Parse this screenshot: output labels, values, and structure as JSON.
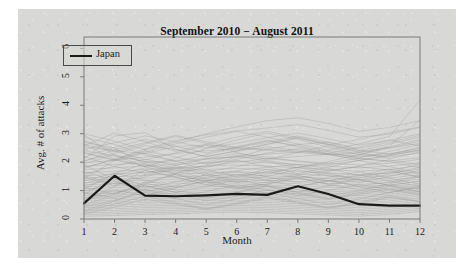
{
  "figure": {
    "background_color": "#d8d8d6",
    "page_color": "#ffffff"
  },
  "chart_data": {
    "type": "line",
    "title": "September 2010 − August 2011",
    "xlabel": "Month",
    "ylabel": "Avg. # of attacks",
    "xlim": [
      1,
      12
    ],
    "ylim": [
      0,
      6.4
    ],
    "xticks": [
      1,
      2,
      3,
      4,
      5,
      6,
      7,
      8,
      9,
      10,
      11,
      12
    ],
    "yticks": [
      0,
      1,
      2,
      3,
      4,
      5,
      6
    ],
    "grid": false,
    "legend": {
      "position": "top-left",
      "entries": [
        {
          "name": "Japan",
          "color": "#1a1a1a"
        }
      ]
    },
    "x": [
      1,
      2,
      3,
      4,
      5,
      6,
      7,
      8,
      9,
      10,
      11,
      12
    ],
    "highlight_series": {
      "name": "Japan",
      "color": "#1a1a1a",
      "linewidth": 2.2,
      "values": [
        0.55,
        1.52,
        0.82,
        0.8,
        0.83,
        0.88,
        0.85,
        1.15,
        0.88,
        0.52,
        0.47,
        0.47
      ]
    },
    "background_series_color": "#8f8f8f",
    "background_series": [
      {
        "name": "country-01",
        "values": [
          2.55,
          2.4,
          2.3,
          2.55,
          2.6,
          2.52,
          2.45,
          2.38,
          2.3,
          2.22,
          2.3,
          2.42
        ]
      },
      {
        "name": "country-02",
        "values": [
          2.4,
          2.22,
          2.02,
          1.96,
          2.1,
          2.2,
          2.28,
          2.35,
          2.4,
          2.28,
          2.18,
          2.32
        ]
      },
      {
        "name": "country-03",
        "values": [
          2.62,
          2.1,
          1.88,
          1.75,
          1.86,
          2.0,
          2.12,
          2.2,
          2.28,
          2.18,
          2.26,
          2.5
        ]
      },
      {
        "name": "country-04",
        "values": [
          1.98,
          2.06,
          2.18,
          2.3,
          2.4,
          2.48,
          2.42,
          2.34,
          2.26,
          2.12,
          2.04,
          2.16
        ]
      },
      {
        "name": "country-05",
        "values": [
          1.86,
          1.92,
          1.98,
          2.06,
          2.12,
          2.18,
          2.12,
          2.04,
          1.96,
          1.9,
          1.96,
          2.1
        ]
      },
      {
        "name": "country-06",
        "values": [
          1.74,
          1.8,
          1.86,
          1.92,
          1.98,
          2.04,
          1.98,
          1.92,
          1.86,
          1.8,
          1.86,
          1.98
        ]
      },
      {
        "name": "country-07",
        "values": [
          1.62,
          1.68,
          1.74,
          1.8,
          1.86,
          1.9,
          1.86,
          1.8,
          1.74,
          1.68,
          1.74,
          1.88
        ]
      },
      {
        "name": "country-08",
        "values": [
          1.52,
          1.58,
          1.64,
          1.7,
          1.74,
          1.78,
          1.74,
          1.68,
          1.62,
          1.56,
          1.62,
          1.76
        ]
      },
      {
        "name": "country-09",
        "values": [
          1.44,
          1.48,
          1.54,
          1.58,
          1.62,
          1.66,
          1.62,
          1.58,
          1.52,
          1.46,
          1.52,
          1.66
        ]
      },
      {
        "name": "country-10",
        "values": [
          1.36,
          1.4,
          1.44,
          1.48,
          1.52,
          1.56,
          1.52,
          1.48,
          1.42,
          1.38,
          1.44,
          1.56
        ]
      },
      {
        "name": "country-11",
        "values": [
          1.28,
          1.32,
          1.36,
          1.4,
          1.44,
          1.48,
          1.44,
          1.4,
          1.34,
          1.3,
          1.36,
          1.48
        ]
      },
      {
        "name": "country-12",
        "values": [
          1.2,
          1.24,
          1.28,
          1.32,
          1.36,
          1.4,
          1.36,
          1.32,
          1.26,
          1.22,
          1.28,
          1.4
        ]
      },
      {
        "name": "country-13",
        "values": [
          1.14,
          1.16,
          1.2,
          1.24,
          1.28,
          1.32,
          1.28,
          1.24,
          1.18,
          1.14,
          1.2,
          1.32
        ]
      },
      {
        "name": "country-14",
        "values": [
          1.06,
          1.1,
          1.14,
          1.16,
          1.2,
          1.24,
          1.2,
          1.16,
          1.12,
          1.08,
          1.14,
          1.24
        ]
      },
      {
        "name": "country-15",
        "values": [
          1.0,
          1.02,
          1.06,
          1.1,
          1.14,
          1.16,
          1.14,
          1.1,
          1.04,
          1.0,
          1.06,
          1.18
        ]
      },
      {
        "name": "country-16",
        "values": [
          0.94,
          0.96,
          1.0,
          1.04,
          1.06,
          1.1,
          1.06,
          1.02,
          0.98,
          0.94,
          1.0,
          1.1
        ]
      },
      {
        "name": "country-17",
        "values": [
          0.88,
          0.9,
          0.94,
          0.96,
          1.0,
          1.02,
          1.0,
          0.96,
          0.92,
          0.88,
          0.94,
          1.04
        ]
      },
      {
        "name": "country-18",
        "values": [
          0.82,
          0.84,
          0.88,
          0.9,
          0.94,
          0.96,
          0.94,
          0.9,
          0.86,
          0.82,
          0.88,
          0.98
        ]
      },
      {
        "name": "country-19",
        "values": [
          0.76,
          0.78,
          0.82,
          0.84,
          0.88,
          0.9,
          0.88,
          0.84,
          0.8,
          0.76,
          0.82,
          0.92
        ]
      },
      {
        "name": "country-20",
        "values": [
          0.7,
          0.72,
          0.76,
          0.78,
          0.82,
          0.84,
          0.82,
          0.78,
          0.74,
          0.7,
          0.76,
          0.86
        ]
      },
      {
        "name": "country-21",
        "values": [
          0.64,
          0.66,
          0.7,
          0.72,
          0.76,
          0.78,
          0.76,
          0.72,
          0.68,
          0.64,
          0.7,
          0.8
        ]
      },
      {
        "name": "country-22",
        "values": [
          0.58,
          0.6,
          0.64,
          0.66,
          0.7,
          0.72,
          0.7,
          0.66,
          0.62,
          0.58,
          0.64,
          0.74
        ]
      },
      {
        "name": "country-23",
        "values": [
          0.52,
          0.54,
          0.58,
          0.6,
          0.64,
          0.66,
          0.64,
          0.6,
          0.56,
          0.52,
          0.58,
          0.68
        ]
      },
      {
        "name": "country-24",
        "values": [
          0.46,
          0.48,
          0.52,
          0.54,
          0.58,
          0.6,
          0.58,
          0.54,
          0.5,
          0.46,
          0.52,
          0.62
        ]
      },
      {
        "name": "country-25",
        "values": [
          0.4,
          0.42,
          0.46,
          0.48,
          0.52,
          0.54,
          0.52,
          0.48,
          0.44,
          0.4,
          0.46,
          0.56
        ]
      },
      {
        "name": "country-26",
        "values": [
          0.34,
          0.36,
          0.4,
          0.42,
          0.46,
          0.48,
          0.46,
          0.42,
          0.38,
          0.34,
          0.4,
          0.5
        ]
      },
      {
        "name": "country-27",
        "values": [
          0.28,
          0.3,
          0.34,
          0.36,
          0.4,
          0.42,
          0.4,
          0.36,
          0.32,
          0.28,
          0.34,
          0.44
        ]
      },
      {
        "name": "country-28",
        "values": [
          0.22,
          0.24,
          0.28,
          0.3,
          0.34,
          0.36,
          0.34,
          0.3,
          0.26,
          0.22,
          0.28,
          0.38
        ]
      },
      {
        "name": "country-29",
        "values": [
          0.16,
          0.18,
          0.22,
          0.24,
          0.28,
          0.3,
          0.28,
          0.24,
          0.2,
          0.16,
          0.22,
          0.32
        ]
      },
      {
        "name": "country-30",
        "values": [
          0.1,
          0.12,
          0.16,
          0.18,
          0.22,
          0.24,
          0.22,
          0.18,
          0.14,
          0.1,
          0.16,
          0.26
        ]
      },
      {
        "name": "country-31",
        "values": [
          1.9,
          1.4,
          1.1,
          1.3,
          1.55,
          1.7,
          1.82,
          1.92,
          1.78,
          1.52,
          1.62,
          1.98
        ]
      },
      {
        "name": "country-32",
        "values": [
          1.05,
          1.6,
          1.95,
          1.7,
          1.42,
          1.28,
          1.38,
          1.56,
          1.7,
          1.84,
          1.72,
          1.48
        ]
      },
      {
        "name": "country-33",
        "values": [
          2.2,
          1.85,
          1.6,
          1.88,
          2.12,
          2.3,
          2.18,
          2.02,
          1.9,
          2.06,
          2.24,
          2.4
        ]
      },
      {
        "name": "country-34",
        "values": [
          0.6,
          1.15,
          1.72,
          1.48,
          1.2,
          1.08,
          1.22,
          1.44,
          1.62,
          1.38,
          1.18,
          1.34
        ]
      },
      {
        "name": "country-35",
        "values": [
          2.7,
          2.5,
          1.92,
          1.62,
          1.9,
          2.18,
          2.46,
          2.62,
          2.7,
          2.42,
          2.28,
          2.52
        ]
      },
      {
        "name": "country-36",
        "values": [
          1.42,
          2.05,
          2.32,
          2.04,
          1.72,
          1.5,
          1.64,
          1.82,
          1.96,
          2.14,
          2.02,
          1.8
        ]
      },
      {
        "name": "country-37",
        "values": [
          0.92,
          0.74,
          1.22,
          1.6,
          1.38,
          1.14,
          1.3,
          1.52,
          1.36,
          1.16,
          1.3,
          1.54
        ]
      },
      {
        "name": "country-38",
        "values": [
          2.05,
          2.3,
          2.58,
          2.44,
          2.2,
          2.38,
          2.54,
          2.42,
          2.26,
          2.34,
          2.5,
          2.66
        ]
      },
      {
        "name": "country-39",
        "values": [
          0.3,
          0.62,
          1.04,
          0.86,
          0.64,
          0.8,
          1.02,
          0.88,
          0.7,
          0.86,
          1.06,
          0.9
        ]
      },
      {
        "name": "country-40",
        "values": [
          1.68,
          1.34,
          0.96,
          1.18,
          1.46,
          1.66,
          1.48,
          1.28,
          1.46,
          1.66,
          1.44,
          1.22
        ]
      },
      {
        "name": "country-41",
        "values": [
          2.45,
          2.68,
          2.92,
          2.72,
          2.5,
          2.66,
          2.86,
          3.02,
          2.82,
          2.6,
          2.76,
          3.0
        ]
      },
      {
        "name": "country-42",
        "values": [
          1.12,
          0.88,
          1.3,
          1.56,
          1.3,
          1.06,
          1.24,
          1.46,
          1.22,
          1.02,
          1.24,
          1.48
        ]
      },
      {
        "name": "country-43",
        "values": [
          2.32,
          2.08,
          2.46,
          2.76,
          2.96,
          3.1,
          3.2,
          3.32,
          3.12,
          2.88,
          2.98,
          3.22
        ]
      },
      {
        "name": "country-44",
        "values": [
          0.48,
          0.86,
          1.26,
          1.02,
          0.8,
          0.96,
          1.18,
          1.04,
          0.84,
          0.98,
          1.2,
          1.06
        ]
      },
      {
        "name": "country-45",
        "values": [
          1.78,
          2.12,
          2.4,
          2.18,
          1.94,
          2.1,
          2.32,
          2.48,
          2.28,
          2.06,
          2.22,
          2.44
        ]
      },
      {
        "name": "country-46",
        "values": [
          2.88,
          2.62,
          2.26,
          2.02,
          2.26,
          2.52,
          2.74,
          2.58,
          2.36,
          2.14,
          2.38,
          2.62
        ]
      },
      {
        "name": "country-47",
        "values": [
          0.98,
          1.28,
          1.02,
          0.78,
          0.96,
          1.2,
          1.02,
          0.82,
          1.0,
          1.22,
          1.04,
          0.84
        ]
      },
      {
        "name": "country-48",
        "values": [
          1.58,
          1.86,
          2.1,
          1.88,
          1.66,
          1.84,
          2.06,
          1.88,
          1.68,
          1.86,
          2.08,
          1.9
        ]
      },
      {
        "name": "country-49",
        "values": [
          2.12,
          2.92,
          3.04,
          2.46,
          2.18,
          2.4,
          2.62,
          2.84,
          2.62,
          2.36,
          2.54,
          2.8
        ]
      },
      {
        "name": "country-50",
        "values": [
          0.72,
          1.02,
          0.82,
          1.1,
          1.34,
          1.12,
          0.9,
          1.14,
          1.36,
          1.14,
          0.92,
          1.16
        ]
      },
      {
        "name": "country-51",
        "values": [
          2.96,
          2.24,
          1.84,
          2.14,
          2.48,
          2.78,
          3.02,
          2.8,
          2.52,
          2.26,
          2.5,
          2.74
        ]
      },
      {
        "name": "country-52",
        "values": [
          1.24,
          1.54,
          1.8,
          1.56,
          1.32,
          1.52,
          1.74,
          1.54,
          1.32,
          1.52,
          1.76,
          1.58
        ]
      },
      {
        "name": "country-53",
        "values": [
          0.18,
          0.42,
          0.7,
          0.52,
          0.34,
          0.52,
          0.74,
          0.56,
          0.38,
          0.54,
          0.76,
          0.6
        ]
      },
      {
        "name": "country-54",
        "values": [
          2.58,
          3.02,
          2.72,
          2.38,
          2.62,
          2.88,
          3.08,
          2.86,
          2.6,
          2.8,
          3.04,
          3.24
        ]
      },
      {
        "name": "country-55",
        "values": [
          1.46,
          1.18,
          1.48,
          1.78,
          1.54,
          1.3,
          1.5,
          1.74,
          1.52,
          1.28,
          1.5,
          1.72
        ]
      },
      {
        "name": "country-56",
        "values": [
          0.86,
          1.46,
          1.18,
          0.94,
          1.14,
          1.38,
          1.16,
          0.94,
          1.16,
          1.4,
          1.18,
          0.96
        ]
      },
      {
        "name": "country-57",
        "values": [
          2.02,
          2.44,
          2.68,
          2.94,
          2.72,
          2.5,
          2.7,
          2.92,
          2.7,
          2.48,
          2.7,
          2.94
        ]
      },
      {
        "name": "country-58",
        "values": [
          3.0,
          2.74,
          2.44,
          2.7,
          3.0,
          3.24,
          3.46,
          3.56,
          3.36,
          3.08,
          3.22,
          3.46
        ]
      },
      {
        "name": "country-59",
        "values": [
          2.34,
          2.06,
          2.36,
          2.64,
          2.88,
          3.08,
          2.88,
          2.64,
          2.42,
          2.64,
          2.9,
          4.18
        ]
      },
      {
        "name": "country-60",
        "values": [
          1.94,
          2.26,
          2.02,
          1.78,
          2.0,
          2.24,
          2.02,
          1.8,
          2.02,
          2.26,
          2.56,
          3.48
        ]
      },
      {
        "name": "country-61",
        "values": [
          0.42,
          0.66,
          0.94,
          0.72,
          0.5,
          0.7,
          0.92,
          0.72,
          0.52,
          0.7,
          0.94,
          1.12
        ]
      },
      {
        "name": "country-62",
        "values": [
          1.34,
          1.62,
          1.36,
          1.12,
          1.34,
          1.58,
          1.36,
          1.14,
          1.34,
          1.56,
          1.34,
          1.14
        ]
      },
      {
        "name": "country-63",
        "values": [
          2.76,
          2.4,
          2.08,
          2.32,
          2.58,
          2.34,
          2.1,
          2.34,
          2.58,
          2.34,
          2.12,
          2.36
        ]
      },
      {
        "name": "country-64",
        "values": [
          0.64,
          0.92,
          1.16,
          0.94,
          0.72,
          0.92,
          1.14,
          0.94,
          0.72,
          0.92,
          1.14,
          0.96
        ]
      },
      {
        "name": "country-65",
        "values": [
          1.52,
          1.24,
          1.54,
          1.82,
          1.6,
          1.36,
          1.58,
          1.82,
          1.58,
          1.36,
          1.58,
          1.82
        ]
      },
      {
        "name": "country-66",
        "values": [
          2.18,
          2.52,
          2.8,
          2.56,
          2.32,
          2.54,
          2.78,
          2.54,
          2.3,
          2.52,
          2.78,
          2.56
        ]
      },
      {
        "name": "country-67",
        "values": [
          0.26,
          0.52,
          0.8,
          0.58,
          0.36,
          0.56,
          0.8,
          0.6,
          0.4,
          0.58,
          0.82,
          0.62
        ]
      },
      {
        "name": "country-68",
        "values": [
          1.16,
          1.44,
          1.7,
          1.46,
          1.22,
          1.44,
          1.68,
          1.44,
          1.22,
          1.44,
          1.68,
          1.46
        ]
      },
      {
        "name": "country-69",
        "values": [
          2.64,
          2.36,
          2.64,
          2.9,
          2.66,
          2.42,
          2.64,
          2.88,
          2.64,
          2.4,
          2.64,
          2.88
        ]
      },
      {
        "name": "country-70",
        "values": [
          1.82,
          2.08,
          1.84,
          1.6,
          1.82,
          2.06,
          1.84,
          1.6,
          1.82,
          2.06,
          1.84,
          1.62
        ]
      }
    ]
  }
}
